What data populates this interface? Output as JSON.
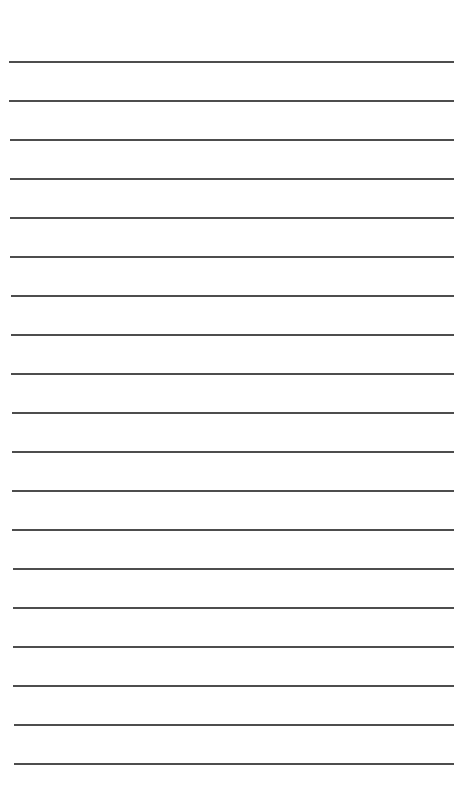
{
  "page": {
    "type": "lined-paper",
    "background_color": "#ffffff",
    "line_color": "#3a3a3a",
    "line_count": 19,
    "first_line_y": 62,
    "line_spacing": 39,
    "line_left_start": 9,
    "line_left_end": 14,
    "line_right": 454
  }
}
